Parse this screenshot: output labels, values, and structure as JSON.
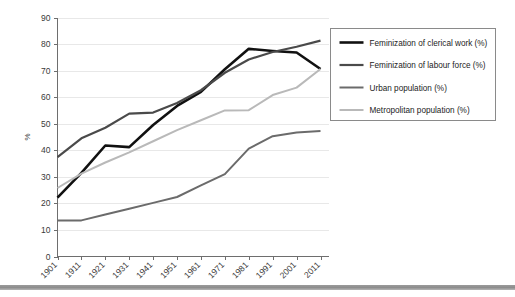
{
  "chart_data": {
    "type": "line",
    "title": "",
    "xlabel": "",
    "ylabel": "%",
    "ylim": [
      0,
      90
    ],
    "ytick_step": 10,
    "yticks": [
      0,
      10,
      20,
      30,
      40,
      50,
      60,
      70,
      80,
      90
    ],
    "grid": true,
    "legend_position": "right",
    "categories": [
      "1901",
      "1911",
      "1921",
      "1931",
      "1941",
      "1951",
      "1961",
      "1971",
      "1981",
      "1991",
      "2001",
      "2011"
    ],
    "series": [
      {
        "name": "Feminization of clerical work (%)",
        "color": "#111111",
        "values": [
          22.2,
          31.5,
          41.8,
          41.2,
          49.5,
          56.7,
          62.0,
          70.5,
          78.2,
          77.4,
          76.8,
          70.6
        ]
      },
      {
        "name": "Feminization of labour force (%)",
        "color": "#4a4a4a",
        "values": [
          37.4,
          44.5,
          48.5,
          53.8,
          54.2,
          57.8,
          62.6,
          69.2,
          74.2,
          77.0,
          79.0,
          81.3
        ]
      },
      {
        "name": "Urban population (%)",
        "color": "#6b6b6b",
        "values": [
          13.6,
          13.6,
          15.8,
          18.0,
          20.2,
          22.4,
          26.8,
          31.0,
          40.6,
          45.3,
          46.7,
          47.3
        ]
      },
      {
        "name": "Metropolitan population (%)",
        "color": "#b9b9b9",
        "values": [
          25.8,
          31.2,
          35.4,
          39.2,
          43.4,
          47.6,
          51.3,
          55.0,
          55.1,
          60.8,
          63.6,
          70.6
        ]
      }
    ]
  },
  "axis": {
    "y_axis_label": "%"
  },
  "legend": {
    "entries": [
      {
        "label": "Feminization of clerical work (%)",
        "color": "#111111",
        "width": 2.6
      },
      {
        "label": "Feminization of labour force (%)",
        "color": "#4a4a4a",
        "width": 2.2
      },
      {
        "label": "Urban population (%)",
        "color": "#6b6b6b",
        "width": 2.0
      },
      {
        "label": "Metropolitan population (%)",
        "color": "#b9b9b9",
        "width": 2.0
      }
    ]
  }
}
